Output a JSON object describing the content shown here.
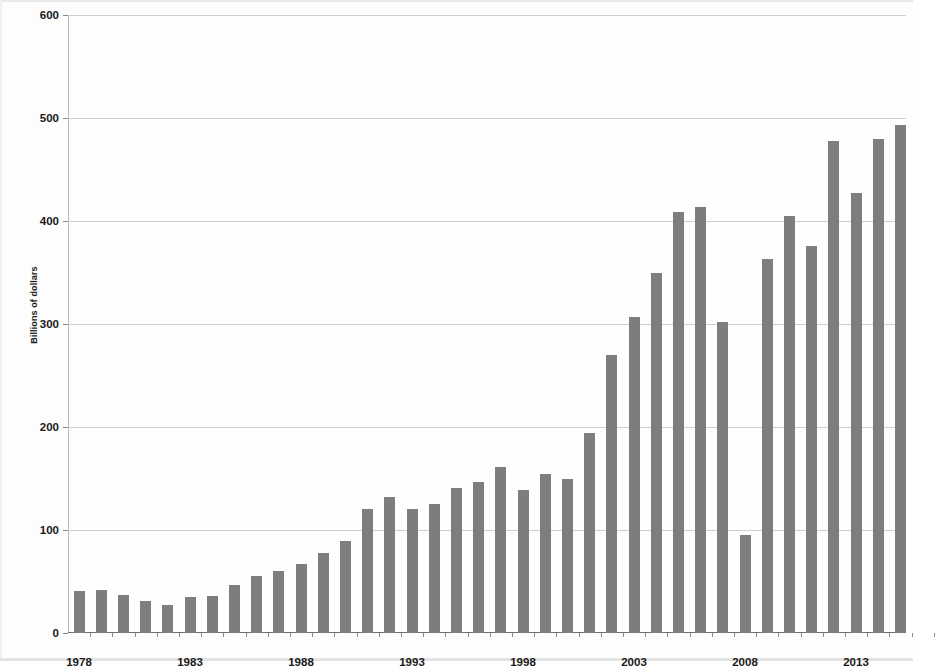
{
  "chart_data": {
    "type": "bar",
    "title": "",
    "xlabel": "",
    "ylabel": "Billions of dollars",
    "ylim": [
      0,
      600
    ],
    "ytick_values": [
      0,
      100,
      200,
      300,
      400,
      500,
      600
    ],
    "ytick_labels": [
      "0",
      "100",
      "200",
      "300",
      "400",
      "500",
      "600"
    ],
    "grid": true,
    "legend": false,
    "bar_color": "#7d7d7d",
    "xtick_labels": [
      "1978",
      "1983",
      "1988",
      "1993",
      "1998",
      "2003",
      "2008",
      "2013"
    ],
    "xtick_years": [
      1978,
      1983,
      1988,
      1993,
      1998,
      2003,
      2008,
      2013
    ],
    "categories": [
      "1978",
      "1979",
      "1980",
      "1981",
      "1982",
      "1983",
      "1984",
      "1985",
      "1986",
      "1987",
      "1988",
      "1989",
      "1990",
      "1991",
      "1992",
      "1993",
      "1994",
      "1995",
      "1996",
      "1997",
      "1998",
      "1999",
      "2000",
      "2001",
      "2002",
      "2003",
      "2004",
      "2005",
      "2006",
      "2007",
      "2008",
      "2009",
      "2010",
      "2011",
      "2012",
      "2013",
      "2014",
      "2015",
      "2016"
    ],
    "values": [
      41,
      42,
      37,
      31,
      27,
      35,
      36,
      47,
      55,
      60,
      67,
      78,
      89,
      120,
      132,
      120,
      125,
      141,
      147,
      161,
      139,
      154,
      150,
      194,
      270,
      307,
      350,
      409,
      414,
      302,
      95,
      363,
      405,
      376,
      478,
      427,
      480,
      493,
      0
    ]
  }
}
